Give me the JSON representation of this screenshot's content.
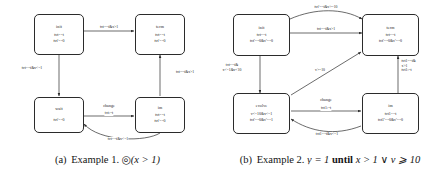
{
  "figure": {
    "panels": [
      {
        "id": "a",
        "caption_tag": "(a)",
        "caption_text": "Example 1.",
        "caption_formula_op": "◎",
        "caption_formula_rest": "(x > 1)",
        "nodes": [
          {
            "id": "init",
            "name": "init",
            "inv1": "tvt==t",
            "inv2": "tvt'==0"
          },
          {
            "id": "term",
            "name": "term",
            "inv1": "tvt==t",
            "inv2": "tvt'==0"
          },
          {
            "id": "wait",
            "name": "wait",
            "inv1": "",
            "inv2": "tvt'==0"
          },
          {
            "id": "im",
            "name": "im",
            "inv1": "tvt==t",
            "inv2": "tvt'==0"
          }
        ],
        "edges": [
          {
            "id": "init-term",
            "label": "tvt==t&x>1"
          },
          {
            "id": "init-wait",
            "label": "tvt==t&x<=1"
          },
          {
            "id": "im-term",
            "label": "tvt==t&x>1"
          },
          {
            "id": "wait-im",
            "label": "tvt:=t",
            "event": "change"
          },
          {
            "id": "im-wait",
            "label": "tvt==t&x<=1"
          }
        ]
      },
      {
        "id": "b",
        "caption_tag": "(b)",
        "caption_text": "Example 2.",
        "caption_formula_lhs": "ṿ = 1",
        "caption_formula_kw": "until",
        "caption_formula_rhs": "x > 1 ∨ v ⩾ 10",
        "nodes": [
          {
            "id": "init",
            "name": "init",
            "inv1": "tvt==t",
            "inv2": "tvt'==0&v'==0"
          },
          {
            "id": "term",
            "name": "term",
            "inv1": "tvt==t",
            "inv2": "tvt'==0&v'==0"
          },
          {
            "id": "evolve",
            "name": "evolve",
            "inv1": "v<=10&x<=1",
            "inv2": "tvt'==0&v'==1"
          },
          {
            "id": "im",
            "name": "im",
            "inv1": "tvt1==t",
            "inv2": "tvt1'==0&v'==0"
          }
        ],
        "edges": [
          {
            "id": "init-term-top",
            "label": "tvt'==t&v>=10"
          },
          {
            "id": "init-term-low",
            "label": "tvt==t&x>1"
          },
          {
            "id": "init-evolve",
            "label": "tvt==t&",
            "label2": "x<=1&v<10"
          },
          {
            "id": "evolve-term",
            "label": "v>=10"
          },
          {
            "id": "evolve-im",
            "label": "tvt1:=t",
            "event": "change"
          },
          {
            "id": "im-evolve",
            "label": "tvt1==t&x<=1"
          },
          {
            "id": "im-term",
            "label": "tvt1==t&",
            "label2": "x>1",
            "label3": "tvt1:=t"
          }
        ]
      }
    ]
  },
  "style": {
    "stroke": "#2b2b2b",
    "text": "#1a1a1a",
    "background": "#ffffff"
  }
}
